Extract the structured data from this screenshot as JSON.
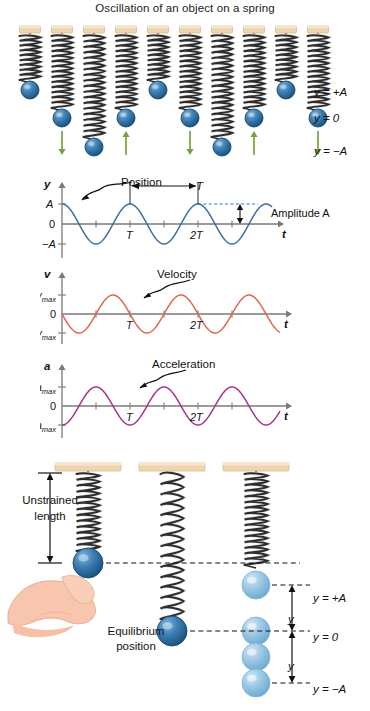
{
  "figure": {
    "title": "Oscillation of an object on a spring",
    "domain": "physics-diagram"
  },
  "top_panel": {
    "name": "spring-oscillation-sequence",
    "count": 10,
    "right_labels": [
      {
        "text": "y = +A",
        "level": "plus_A"
      },
      {
        "text": "y = 0",
        "level": "zero"
      },
      {
        "text": "y = −A",
        "level": "minus_A"
      }
    ],
    "frames": [
      {
        "index": 1,
        "ball_level": "plus_A",
        "arrow": "none"
      },
      {
        "index": 2,
        "ball_level": "zero",
        "arrow": "down"
      },
      {
        "index": 3,
        "ball_level": "minus_A",
        "arrow": "none"
      },
      {
        "index": 4,
        "ball_level": "zero",
        "arrow": "up"
      },
      {
        "index": 5,
        "ball_level": "plus_A",
        "arrow": "none"
      },
      {
        "index": 6,
        "ball_level": "zero",
        "arrow": "down"
      },
      {
        "index": 7,
        "ball_level": "minus_A",
        "arrow": "none"
      },
      {
        "index": 8,
        "ball_level": "zero",
        "arrow": "up"
      },
      {
        "index": 9,
        "ball_level": "plus_A",
        "arrow": "none"
      },
      {
        "index": 10,
        "ball_level": "zero",
        "arrow": "down"
      }
    ]
  },
  "charts": [
    {
      "id": "position",
      "type": "line",
      "curve": "cosine",
      "callout": "Position",
      "color": "#3d6fa5",
      "ylabel": "y",
      "xlabel": "t",
      "ytick_labels": [
        "A",
        "0",
        "−A"
      ],
      "xtick_labels": [
        "T",
        "2T"
      ],
      "annotations": [
        "T",
        "Amplitude A"
      ],
      "amplitude": 1,
      "periods": 2.6,
      "ylim": [
        -1.25,
        1.25
      ]
    },
    {
      "id": "velocity",
      "type": "line",
      "curve": "negative-sine",
      "callout": "Velocity",
      "color": "#e0664f",
      "ylabel": "v",
      "xlabel": "t",
      "ytick_labels": [
        "v_max",
        "0",
        "−v_max"
      ],
      "ytick_base": [
        "v",
        "0",
        "−v"
      ],
      "ytick_sub": "max",
      "xtick_labels": [
        "T",
        "2T"
      ],
      "amplitude": 1,
      "periods": 2.6,
      "ylim": [
        -1.25,
        1.25
      ]
    },
    {
      "id": "acceleration",
      "type": "line",
      "curve": "negative-cosine",
      "callout": "Acceleration",
      "color": "#a8348e",
      "ylabel": "a",
      "xlabel": "t",
      "ytick_labels": [
        "a_max",
        "0",
        "−a_max"
      ],
      "ytick_base": [
        "a",
        "0",
        "−a"
      ],
      "ytick_sub": "max",
      "xtick_labels": [
        "T",
        "2T"
      ],
      "amplitude": 1,
      "periods": 2.6,
      "ylim": [
        -1.25,
        1.25
      ]
    }
  ],
  "bottom_panel": {
    "name": "equilibrium-and-amplitude-diagram",
    "labels": {
      "unstrained": "Unstrained\nlength",
      "unstrained_line1": "Unstrained",
      "unstrained_line2": "length",
      "equilibrium_line1": "Equilibrium",
      "equilibrium_line2": "position",
      "y_plus_A": "y = +A",
      "y_zero": "y = 0",
      "y_minus_A": "y = −A",
      "displacement_upper": "y",
      "displacement_lower": "y"
    },
    "ghost_balls": 4
  },
  "colors": {
    "ceiling": "#efd6b0",
    "ceiling_edge": "#d8bb8e",
    "ball": "#2b6b9e",
    "ball_dark": "#1d4f7c",
    "ball_ghost": "#93c3e0",
    "spring_dark": "#2a2a2a",
    "spring_light": "#e8e8e8",
    "arrow_green": "#7aa23c",
    "hand": "#f6c3ad",
    "axis": "#7a7a7a",
    "text": "#111111"
  }
}
